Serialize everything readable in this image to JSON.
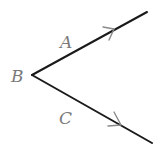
{
  "diagram": {
    "type": "angle",
    "vertex": {
      "label": "B",
      "x": 32,
      "y": 75
    },
    "rays": [
      {
        "name": "A",
        "label": "A",
        "end": {
          "x": 147,
          "y": 12
        },
        "arrow": {
          "x": 113,
          "y": 30
        }
      },
      {
        "name": "C",
        "label": "C",
        "end": {
          "x": 152,
          "y": 143
        },
        "arrow": {
          "x": 120,
          "y": 125
        }
      }
    ],
    "labels": {
      "A": "A",
      "B": "B",
      "C": "C"
    },
    "colors": {
      "line": "#1a1a1a",
      "arrow": "#8a8a8a",
      "label": "#7a7a7a",
      "background": "#ffffff"
    }
  }
}
